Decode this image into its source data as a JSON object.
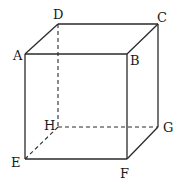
{
  "diagram": {
    "type": "cube",
    "vertices": {
      "A": {
        "label": "A",
        "x": 25,
        "y": 54,
        "lx": 13,
        "ly": 60
      },
      "B": {
        "label": "B",
        "x": 127,
        "y": 54,
        "lx": 130,
        "ly": 65
      },
      "C": {
        "label": "C",
        "x": 158,
        "y": 24,
        "lx": 157,
        "ly": 22
      },
      "D": {
        "label": "D",
        "x": 58,
        "y": 24,
        "lx": 53,
        "ly": 19
      },
      "E": {
        "label": "E",
        "x": 25,
        "y": 159,
        "lx": 11,
        "ly": 167
      },
      "F": {
        "label": "F",
        "x": 127,
        "y": 159,
        "lx": 120,
        "ly": 178
      },
      "G": {
        "label": "G",
        "x": 158,
        "y": 127,
        "lx": 163,
        "ly": 132
      },
      "H": {
        "label": "H",
        "x": 58,
        "y": 127,
        "lx": 44,
        "ly": 130
      }
    },
    "edges_solid": [
      "AB",
      "BC",
      "CD",
      "DA",
      "AE",
      "BF",
      "CG",
      "EF",
      "FG"
    ],
    "edges_hidden": [
      "DH",
      "HE",
      "HG"
    ],
    "colors": {
      "stroke": "#2a2a2a",
      "background": "#ffffff"
    }
  }
}
